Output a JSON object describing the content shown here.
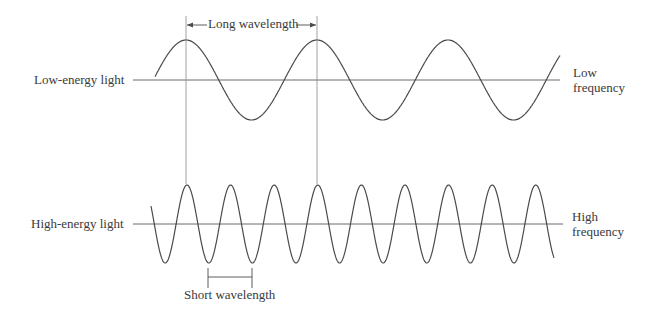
{
  "diagram": {
    "type": "wave-comparison",
    "top_wave": {
      "label": "Low-energy light",
      "right_label_line1": "Low",
      "right_label_line2": "frequency",
      "wavelength_label": "Long wavelength",
      "period_px": 131,
      "amplitude_px": 40,
      "axis_y": 80
    },
    "bottom_wave": {
      "label": "High-energy light",
      "right_label_line1": "High",
      "right_label_line2": "frequency",
      "wavelength_label": "Short wavelength",
      "period_px": 43.6,
      "amplitude_px": 39,
      "axis_y": 224
    },
    "colors": {
      "line": "#4a4a4a",
      "text": "#3a3a3a",
      "background": "#ffffff"
    }
  }
}
